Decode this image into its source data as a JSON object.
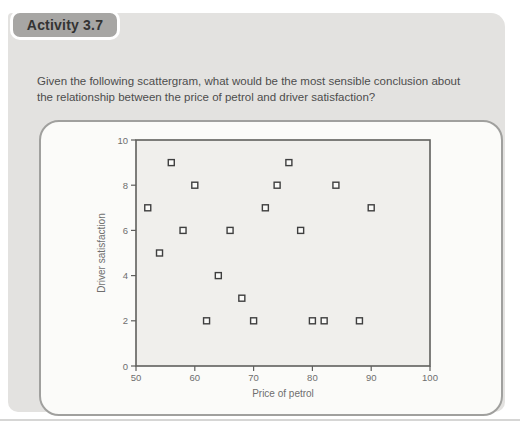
{
  "activity": {
    "badge": "Activity 3.7",
    "question_lines": [
      "Given the following scattergram, what would be the most sensible conclusion about",
      "the relationship between the price of petrol and driver satisfaction?"
    ]
  },
  "chart_data": {
    "type": "scatter",
    "title": "",
    "xlabel": "Price of petrol",
    "ylabel": "Driver satisfaction",
    "xlim": [
      50,
      100
    ],
    "ylim": [
      0,
      10
    ],
    "xticks": [
      50,
      60,
      70,
      80,
      90,
      100
    ],
    "yticks": [
      0,
      2,
      4,
      6,
      8,
      10
    ],
    "grid": false,
    "legend_position": "none",
    "marker": "open-square",
    "points": [
      {
        "x": 52,
        "y": 7
      },
      {
        "x": 54,
        "y": 5
      },
      {
        "x": 56,
        "y": 9
      },
      {
        "x": 58,
        "y": 6
      },
      {
        "x": 60,
        "y": 8
      },
      {
        "x": 62,
        "y": 2
      },
      {
        "x": 64,
        "y": 4
      },
      {
        "x": 66,
        "y": 6
      },
      {
        "x": 68,
        "y": 3
      },
      {
        "x": 70,
        "y": 2
      },
      {
        "x": 72,
        "y": 7
      },
      {
        "x": 74,
        "y": 8
      },
      {
        "x": 76,
        "y": 9
      },
      {
        "x": 78,
        "y": 6
      },
      {
        "x": 80,
        "y": 2
      },
      {
        "x": 82,
        "y": 2
      },
      {
        "x": 84,
        "y": 8
      },
      {
        "x": 88,
        "y": 2
      },
      {
        "x": 90,
        "y": 7
      }
    ]
  },
  "colors": {
    "panel_bg": "#e3e2e0",
    "badge_bg": "#a7a6a4",
    "badge_text": "#333333",
    "question_text": "#4d4d4d",
    "card_bg": "#fbfbf9",
    "card_border": "#a0a09e",
    "plot_bg": "#f0efec",
    "axis": "#5f5f5d",
    "tick_label": "#6e6e6e",
    "marker_stroke": "#3f3f3f",
    "marker_fill": "#fafaf8"
  }
}
